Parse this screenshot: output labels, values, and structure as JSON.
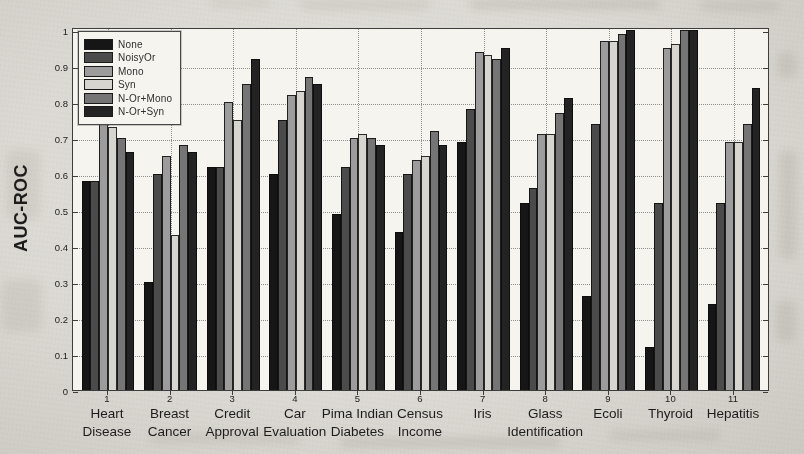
{
  "chart_data": {
    "type": "bar",
    "title": "",
    "xlabel": "",
    "ylabel": "AUC-ROC",
    "ylim": [
      0,
      1
    ],
    "yticks": [
      0,
      0.1,
      0.2,
      0.3,
      0.4,
      0.5,
      0.6,
      0.7,
      0.8,
      0.9,
      1
    ],
    "ytick_labels": [
      "0",
      "0.1",
      "0.2",
      "0.3",
      "0.4",
      "0.5",
      "0.6",
      "0.7",
      "0.8",
      "0.9",
      "1"
    ],
    "grid": "dotted horizontal and vertical gridlines",
    "legend_position": "upper-left inside plot",
    "categories": [
      {
        "num": "1",
        "label": "Heart Disease",
        "lines": [
          "Heart",
          "Disease"
        ]
      },
      {
        "num": "2",
        "label": "Breast Cancer",
        "lines": [
          "Breast",
          "Cancer"
        ]
      },
      {
        "num": "3",
        "label": "Credit Approval",
        "lines": [
          "Credit",
          "Approval"
        ]
      },
      {
        "num": "4",
        "label": "Car Evaluation",
        "lines": [
          "Car",
          "Evaluation"
        ]
      },
      {
        "num": "5",
        "label": "Pima Indian Diabetes",
        "lines": [
          "Pima Indian",
          "Diabetes"
        ]
      },
      {
        "num": "6",
        "label": "Census Income",
        "lines": [
          "Census",
          "Income"
        ]
      },
      {
        "num": "7",
        "label": "Iris",
        "lines": [
          "Iris"
        ]
      },
      {
        "num": "8",
        "label": "Glass Identification",
        "lines": [
          "Glass",
          "Identification"
        ]
      },
      {
        "num": "9",
        "label": "Ecoli",
        "lines": [
          "Ecoli"
        ]
      },
      {
        "num": "10",
        "label": "Thyroid",
        "lines": [
          "Thyroid"
        ]
      },
      {
        "num": "11",
        "label": "Hepatitis",
        "lines": [
          "Hepatitis"
        ]
      }
    ],
    "series": [
      {
        "name": "None",
        "color": "#161616",
        "values": [
          0.58,
          0.3,
          0.62,
          0.6,
          0.49,
          0.44,
          0.69,
          0.52,
          0.26,
          0.12,
          0.24
        ]
      },
      {
        "name": "NoisyOr",
        "color": "#4b4b4b",
        "values": [
          0.58,
          0.6,
          0.62,
          0.75,
          0.62,
          0.6,
          0.78,
          0.56,
          0.74,
          0.52,
          0.52
        ]
      },
      {
        "name": "Mono",
        "color": "#9c9c9c",
        "values": [
          0.74,
          0.65,
          0.8,
          0.82,
          0.7,
          0.64,
          0.94,
          0.71,
          0.97,
          0.95,
          0.69
        ]
      },
      {
        "name": "Syn",
        "color": "#d6d5d0",
        "values": [
          0.73,
          0.43,
          0.75,
          0.83,
          0.71,
          0.65,
          0.93,
          0.71,
          0.97,
          0.96,
          0.69
        ]
      },
      {
        "name": "N-Or+Mono",
        "color": "#757575",
        "values": [
          0.7,
          0.68,
          0.85,
          0.87,
          0.7,
          0.72,
          0.92,
          0.77,
          0.99,
          1.0,
          0.74
        ]
      },
      {
        "name": "N-Or+Syn",
        "color": "#232323",
        "values": [
          0.66,
          0.66,
          0.92,
          0.85,
          0.68,
          0.68,
          0.95,
          0.81,
          1.0,
          1.0,
          0.84
        ]
      }
    ]
  }
}
